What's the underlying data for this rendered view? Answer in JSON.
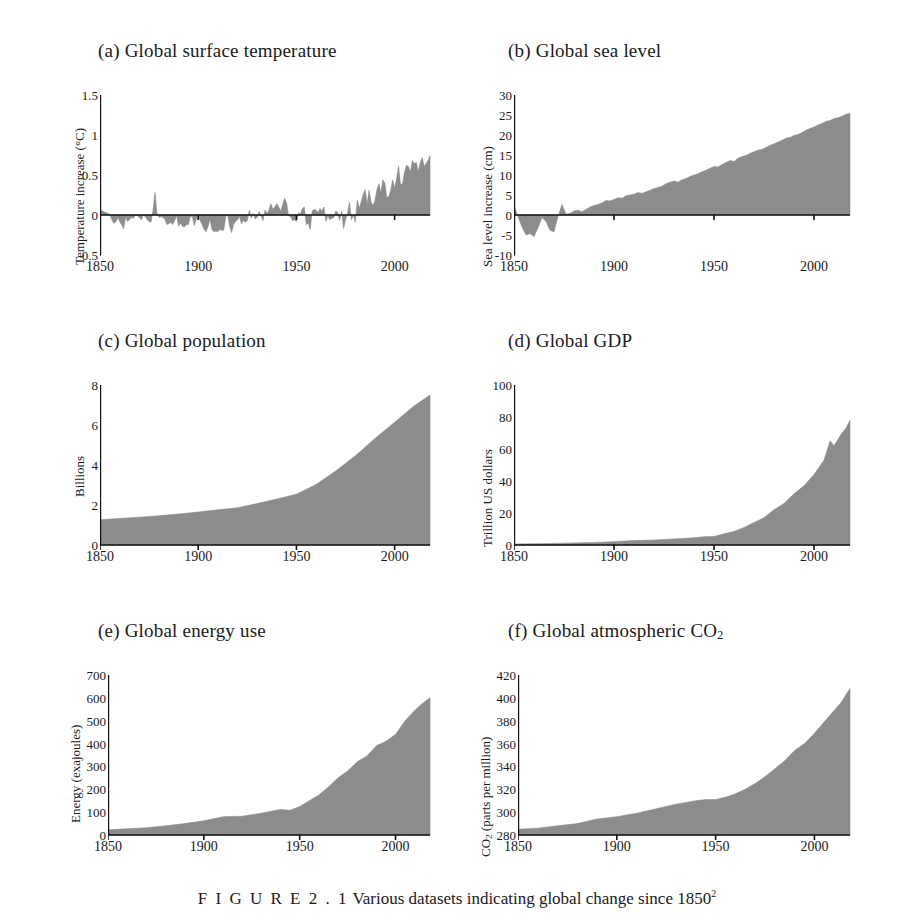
{
  "figure": {
    "caption_label": "F I G U R E  2 . 1",
    "caption_text": "Various datasets indicating global change since 1850",
    "caption_superscript": "2",
    "fill_color": "#8c8c8c",
    "axis_color": "#111111"
  },
  "chart_data": [
    {
      "id": "a",
      "type": "area",
      "title": "(a) Global surface temperature",
      "xlabel": "",
      "ylabel": "Temperature increase (°C)",
      "xlim": [
        1850,
        2018
      ],
      "ylim": [
        -0.5,
        1.5
      ],
      "xticks": [
        1850,
        1900,
        1950,
        2000
      ],
      "yticks": [
        -0.5,
        0,
        0.5,
        1,
        1.5
      ],
      "ytick_labels": [
        "-0.5",
        "0",
        "0.5",
        "1",
        "1.5"
      ],
      "baseline": 0,
      "grid": false,
      "legend": "none",
      "x": [
        1850,
        1851,
        1852,
        1853,
        1854,
        1855,
        1856,
        1857,
        1858,
        1859,
        1860,
        1861,
        1862,
        1863,
        1864,
        1865,
        1866,
        1867,
        1868,
        1869,
        1870,
        1871,
        1872,
        1873,
        1874,
        1875,
        1876,
        1877,
        1878,
        1879,
        1880,
        1881,
        1882,
        1883,
        1884,
        1885,
        1886,
        1887,
        1888,
        1889,
        1890,
        1891,
        1892,
        1893,
        1894,
        1895,
        1896,
        1897,
        1898,
        1899,
        1900,
        1901,
        1902,
        1903,
        1904,
        1905,
        1906,
        1907,
        1908,
        1909,
        1910,
        1911,
        1912,
        1913,
        1914,
        1915,
        1916,
        1917,
        1918,
        1919,
        1920,
        1921,
        1922,
        1923,
        1924,
        1925,
        1926,
        1927,
        1928,
        1929,
        1930,
        1931,
        1932,
        1933,
        1934,
        1935,
        1936,
        1937,
        1938,
        1939,
        1940,
        1941,
        1942,
        1943,
        1944,
        1945,
        1946,
        1947,
        1948,
        1949,
        1950,
        1951,
        1952,
        1953,
        1954,
        1955,
        1956,
        1957,
        1958,
        1959,
        1960,
        1961,
        1962,
        1963,
        1964,
        1965,
        1966,
        1967,
        1968,
        1969,
        1970,
        1971,
        1972,
        1973,
        1974,
        1975,
        1976,
        1977,
        1978,
        1979,
        1980,
        1981,
        1982,
        1983,
        1984,
        1985,
        1986,
        1987,
        1988,
        1989,
        1990,
        1991,
        1992,
        1993,
        1994,
        1995,
        1996,
        1997,
        1998,
        1999,
        2000,
        2001,
        2002,
        2003,
        2004,
        2005,
        2006,
        2007,
        2008,
        2009,
        2010,
        2011,
        2012,
        2013,
        2014,
        2015,
        2016,
        2017,
        2018
      ],
      "values": [
        0.08,
        0.05,
        0.04,
        0.03,
        0.02,
        0.01,
        -0.06,
        -0.1,
        -0.09,
        -0.03,
        -0.08,
        -0.12,
        -0.17,
        -0.03,
        -0.08,
        -0.06,
        -0.03,
        -0.04,
        0.0,
        -0.01,
        -0.03,
        -0.06,
        0.0,
        -0.02,
        -0.06,
        -0.08,
        -0.09,
        0.06,
        0.28,
        0.02,
        -0.03,
        -0.02,
        -0.03,
        -0.05,
        -0.12,
        -0.11,
        -0.09,
        -0.12,
        -0.07,
        -0.01,
        -0.14,
        -0.1,
        -0.14,
        -0.15,
        -0.12,
        -0.12,
        -0.02,
        -0.02,
        -0.13,
        -0.05,
        0.0,
        -0.07,
        -0.12,
        -0.18,
        -0.21,
        -0.14,
        -0.05,
        -0.18,
        -0.21,
        -0.2,
        -0.21,
        -0.18,
        -0.19,
        -0.19,
        -0.02,
        0.0,
        -0.14,
        -0.22,
        -0.12,
        -0.08,
        -0.06,
        -0.02,
        -0.11,
        -0.07,
        -0.09,
        -0.07,
        0.06,
        -0.04,
        0.02,
        -0.05,
        -0.03,
        0.04,
        -0.01,
        -0.07,
        0.06,
        0.02,
        0.06,
        0.14,
        0.07,
        0.1,
        0.14,
        0.1,
        0.05,
        0.13,
        0.21,
        0.15,
        -0.01,
        -0.02,
        -0.07,
        -0.06,
        -0.08,
        0.03,
        0.01,
        0.08,
        0.1,
        -0.12,
        -0.1,
        -0.18,
        0.05,
        0.07,
        0.06,
        0.03,
        0.08,
        0.05,
        0.1,
        -0.08,
        -0.01,
        -0.06,
        -0.04,
        -0.03,
        0.05,
        0.03,
        -0.07,
        0.05,
        -0.17,
        -0.06,
        0.02,
        0.16,
        -0.06,
        0.0,
        -0.09,
        0.19,
        0.08,
        0.17,
        0.26,
        0.32,
        0.14,
        0.31,
        0.16,
        0.12,
        0.18,
        0.32,
        0.39,
        0.28,
        0.44,
        0.4,
        0.22,
        0.23,
        0.31,
        0.44,
        0.33,
        0.46,
        0.61,
        0.38,
        0.39,
        0.53,
        0.62,
        0.61,
        0.53,
        0.68,
        0.64,
        0.66,
        0.54,
        0.65,
        0.72,
        0.61,
        0.64,
        0.68,
        0.74,
        0.9,
        1.01,
        0.92,
        0.85
      ]
    },
    {
      "id": "b",
      "type": "area",
      "title": "(b) Global sea level",
      "xlabel": "",
      "ylabel": "Sea level increase (cm)",
      "xlim": [
        1850,
        2018
      ],
      "ylim": [
        -10,
        30
      ],
      "xticks": [
        1850,
        1900,
        1950,
        2000
      ],
      "yticks": [
        -10,
        -5,
        0,
        5,
        10,
        15,
        20,
        25,
        30
      ],
      "ytick_labels": [
        "-10",
        "-5",
        "0",
        "5",
        "10",
        "15",
        "20",
        "25",
        "30"
      ],
      "baseline": 0,
      "grid": false,
      "legend": "none",
      "x": [
        1850,
        1852,
        1854,
        1856,
        1858,
        1860,
        1862,
        1864,
        1866,
        1868,
        1870,
        1872,
        1874,
        1876,
        1878,
        1880,
        1882,
        1884,
        1886,
        1888,
        1890,
        1892,
        1894,
        1896,
        1898,
        1900,
        1902,
        1904,
        1906,
        1908,
        1910,
        1912,
        1914,
        1916,
        1918,
        1920,
        1922,
        1924,
        1926,
        1928,
        1930,
        1932,
        1934,
        1936,
        1938,
        1940,
        1942,
        1944,
        1946,
        1948,
        1950,
        1952,
        1954,
        1956,
        1958,
        1960,
        1962,
        1964,
        1966,
        1968,
        1970,
        1972,
        1974,
        1976,
        1978,
        1980,
        1982,
        1984,
        1986,
        1988,
        1990,
        1992,
        1994,
        1996,
        1998,
        2000,
        2002,
        2004,
        2006,
        2008,
        2010,
        2012,
        2014,
        2016,
        2018
      ],
      "values": [
        2.4,
        -0.4,
        -3.0,
        -5.0,
        -4.6,
        -5.4,
        -3.2,
        -0.6,
        -1.6,
        -3.8,
        -4.2,
        -0.4,
        2.6,
        0.2,
        0.4,
        1.0,
        1.2,
        0.8,
        1.4,
        2.0,
        2.4,
        2.6,
        3.0,
        3.6,
        3.5,
        3.9,
        4.3,
        4.2,
        4.8,
        5.0,
        5.2,
        5.6,
        5.4,
        5.8,
        6.2,
        6.6,
        6.9,
        7.2,
        7.8,
        8.2,
        8.5,
        8.2,
        8.8,
        9.1,
        9.6,
        10.0,
        10.3,
        10.8,
        11.2,
        11.7,
        12.1,
        12.0,
        12.6,
        13.1,
        13.6,
        13.4,
        14.2,
        14.6,
        14.9,
        15.4,
        15.8,
        16.2,
        16.4,
        16.9,
        17.4,
        17.8,
        18.2,
        18.7,
        19.2,
        19.4,
        19.9,
        20.1,
        20.6,
        21.2,
        21.6,
        22.0,
        22.5,
        22.9,
        23.4,
        23.6,
        24.1,
        24.3,
        24.7,
        25.2,
        25.4
      ]
    },
    {
      "id": "c",
      "type": "area",
      "title": "(c) Global population",
      "xlabel": "",
      "ylabel": "Billions",
      "xlim": [
        1850,
        2018
      ],
      "ylim": [
        0,
        8
      ],
      "xticks": [
        1850,
        1900,
        1950,
        2000
      ],
      "yticks": [
        0,
        2,
        4,
        6,
        8
      ],
      "ytick_labels": [
        "0",
        "2",
        "4",
        "6",
        "8"
      ],
      "baseline": 0,
      "grid": false,
      "legend": "none",
      "x": [
        1850,
        1860,
        1870,
        1880,
        1890,
        1900,
        1910,
        1920,
        1930,
        1940,
        1950,
        1960,
        1970,
        1980,
        1990,
        2000,
        2010,
        2018
      ],
      "values": [
        1.26,
        1.33,
        1.39,
        1.46,
        1.55,
        1.65,
        1.76,
        1.86,
        2.07,
        2.3,
        2.54,
        3.03,
        3.7,
        4.46,
        5.33,
        6.14,
        6.96,
        7.5
      ]
    },
    {
      "id": "d",
      "type": "area",
      "title": "(d) Global GDP",
      "xlabel": "",
      "ylabel": "Trillion US dollars",
      "xlim": [
        1850,
        2018
      ],
      "ylim": [
        0,
        100
      ],
      "xticks": [
        1850,
        1900,
        1950,
        2000
      ],
      "yticks": [
        0,
        20,
        40,
        60,
        80,
        100
      ],
      "ytick_labels": [
        "0",
        "20",
        "40",
        "60",
        "80",
        "100"
      ],
      "baseline": 0,
      "grid": false,
      "legend": "none",
      "x": [
        1850,
        1860,
        1870,
        1880,
        1890,
        1900,
        1910,
        1920,
        1930,
        1940,
        1945,
        1950,
        1955,
        1960,
        1965,
        1970,
        1975,
        1980,
        1985,
        1990,
        1995,
        2000,
        2005,
        2008,
        2010,
        2014,
        2016,
        2018
      ],
      "values": [
        0.6,
        0.8,
        1.0,
        1.3,
        1.6,
        2.1,
        2.8,
        3.1,
        3.8,
        4.5,
        5.2,
        5.3,
        7.0,
        8.5,
        11.0,
        14.0,
        17.0,
        22.0,
        26.0,
        32.0,
        37.0,
        44.0,
        53.0,
        65.0,
        62.0,
        70.0,
        73.0,
        78.0
      ]
    },
    {
      "id": "e",
      "type": "area",
      "title": "(e) Global energy use",
      "xlabel": "",
      "ylabel": "Energy (exajoules)",
      "xlim": [
        1850,
        2018
      ],
      "ylim": [
        0,
        700
      ],
      "xticks": [
        1850,
        1900,
        1950,
        2000
      ],
      "yticks": [
        0,
        100,
        200,
        300,
        400,
        500,
        600,
        700
      ],
      "ytick_labels": [
        "0",
        "100",
        "200",
        "300",
        "400",
        "500",
        "600",
        "700"
      ],
      "baseline": 0,
      "grid": false,
      "legend": "none",
      "x": [
        1850,
        1860,
        1870,
        1880,
        1890,
        1900,
        1910,
        1920,
        1930,
        1940,
        1945,
        1950,
        1955,
        1960,
        1965,
        1970,
        1975,
        1980,
        1985,
        1990,
        1995,
        2000,
        2005,
        2010,
        2014,
        2018
      ],
      "values": [
        23,
        27,
        32,
        40,
        50,
        62,
        80,
        82,
        95,
        112,
        108,
        125,
        150,
        175,
        210,
        250,
        280,
        320,
        345,
        390,
        410,
        440,
        500,
        545,
        575,
        600
      ]
    },
    {
      "id": "f",
      "type": "area",
      "title": "(f) Global atmospheric CO2",
      "title_prefix": "(f) Global atmospheric CO",
      "title_subscript": "2",
      "xlabel": "",
      "ylabel": "CO2 (parts per million)",
      "ylabel_prefix": "CO",
      "ylabel_subscript": "2",
      "ylabel_suffix": " (parts per million)",
      "xlim": [
        1850,
        2018
      ],
      "ylim": [
        280,
        420
      ],
      "xticks": [
        1850,
        1900,
        1950,
        2000
      ],
      "yticks": [
        280,
        300,
        320,
        340,
        360,
        380,
        400,
        420
      ],
      "ytick_labels": [
        "280",
        "300",
        "320",
        "340",
        "360",
        "380",
        "400",
        "420"
      ],
      "baseline": 280,
      "grid": false,
      "legend": "none",
      "x": [
        1850,
        1860,
        1870,
        1880,
        1890,
        1900,
        1910,
        1920,
        1930,
        1940,
        1945,
        1950,
        1955,
        1960,
        1965,
        1970,
        1975,
        1980,
        1985,
        1990,
        1995,
        2000,
        2005,
        2010,
        2014,
        2016,
        2018
      ],
      "values": [
        285,
        286,
        288,
        290,
        294,
        296,
        299,
        303,
        307,
        310,
        311,
        311,
        313,
        316,
        320,
        325,
        331,
        338,
        345,
        354,
        360,
        369,
        379,
        389,
        397,
        403,
        408
      ]
    }
  ]
}
